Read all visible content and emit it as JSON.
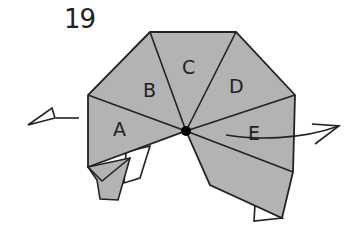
{
  "diagram": {
    "step_number": "19",
    "segment_labels": [
      "A",
      "B",
      "C",
      "D",
      "E"
    ],
    "colors": {
      "paper_fill": "#b3b3b3",
      "paper_back": "#ffffff",
      "line": "#222222",
      "pivot_dot": "#000000"
    },
    "annotations": {
      "left_arrow": "valley-fold-push-arrow-left",
      "right_arrow": "curved-arrow-right",
      "pivot": "pivot-point"
    }
  }
}
